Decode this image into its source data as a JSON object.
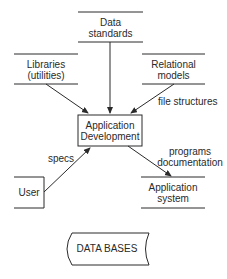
{
  "diagram": {
    "nodes": {
      "data_standards": {
        "line1": "Data",
        "line2": "standards"
      },
      "libraries": {
        "line1": "Libraries",
        "line2": "(utilities)"
      },
      "relational_models": {
        "line1": "Relational",
        "line2": "models"
      },
      "application_development": {
        "line1": "Application",
        "line2": "Development"
      },
      "user": {
        "label": "User"
      },
      "application_system": {
        "line1": "Application",
        "line2": "system"
      },
      "data_bases": {
        "label": "DATA BASES"
      }
    },
    "edges": {
      "file_structures": "file structures",
      "specs": "specs",
      "outputs_line1": "programs",
      "outputs_line2": "documentation"
    },
    "colors": {
      "stroke": "#2a2a2a",
      "background": "#ffffff"
    }
  }
}
